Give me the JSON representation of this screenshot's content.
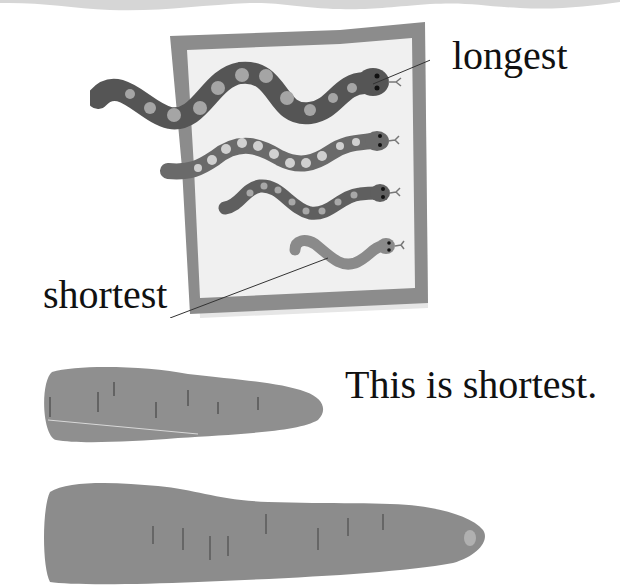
{
  "page": {
    "labels": {
      "longest": "longest",
      "shortest": "shortest"
    },
    "sentence": "This is shortest.",
    "illustrations": {
      "quilt": "snake-quilt-illustration",
      "carrot_short": "short-carrot-photo",
      "carrot_long": "long-carrot-photo"
    },
    "snakes": [
      {
        "rank": 1,
        "size": "longest"
      },
      {
        "rank": 2,
        "size": "long"
      },
      {
        "rank": 3,
        "size": "medium"
      },
      {
        "rank": 4,
        "size": "shortest"
      }
    ],
    "colors": {
      "background": "#ffffff",
      "text": "#111111",
      "quilt_border": "#8c8c8c",
      "quilt_fill": "#f0f0f0",
      "snake_dark": "#555555",
      "snake_mid": "#777777",
      "snake_light": "#8a8a8a",
      "spot": "#b5b5b5",
      "carrot": "#8f8f8f",
      "wave": "#d6d6d6"
    }
  }
}
